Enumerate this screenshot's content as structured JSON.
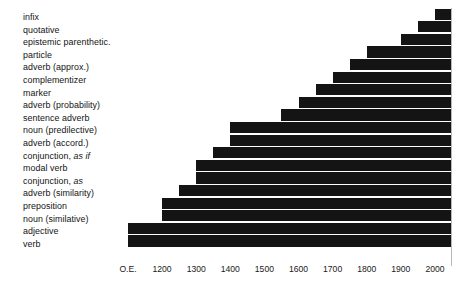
{
  "chart_data": {
    "type": "bar",
    "orientation": "horizontal",
    "title": "",
    "subtitle": "",
    "xlabel": "",
    "ylabel": "",
    "grid": false,
    "legend": null,
    "bar_color": "#141414",
    "background_color": "#ffffff",
    "axis_color": "#b9b9b9",
    "xlim": [
      1100,
      2050
    ],
    "x_tick_labels": [
      "O.E.",
      "1200",
      "1300",
      "1400",
      "1500",
      "1600",
      "1700",
      "1800",
      "1900",
      "2000"
    ],
    "x_tick_values": [
      1100,
      1200,
      1300,
      1400,
      1500,
      1600,
      1700,
      1800,
      1900,
      2000
    ],
    "note": "Each bar spans from its first-attestation date to the present (2050 right edge); bar length encodes duration of attested use.",
    "categories": [
      "infix",
      "quotative",
      "epistemic parenthetic.",
      "particle",
      "adverb (approx.)",
      "complementizer",
      "marker",
      "adverb (probability)",
      "sentence adverb",
      "noun (predilective)",
      "adverb (accord.)",
      "conjunction, as if",
      "modal verb",
      "conjunction, as",
      "adverb (similarity)",
      "preposition",
      "noun (similative)",
      "adjective",
      "verb"
    ],
    "bars": [
      {
        "label": "infix",
        "label_plain": "infix",
        "label_italic": "",
        "start": 2000,
        "end": 2050
      },
      {
        "label": "quotative",
        "label_plain": "quotative",
        "label_italic": "",
        "start": 1950,
        "end": 2050
      },
      {
        "label": "epistemic parenthetic.",
        "label_plain": "epistemic parenthetic.",
        "label_italic": "",
        "start": 1900,
        "end": 2050
      },
      {
        "label": "particle",
        "label_plain": "particle",
        "label_italic": "",
        "start": 1800,
        "end": 2050
      },
      {
        "label": "adverb (approx.)",
        "label_plain": "adverb (approx.)",
        "label_italic": "",
        "start": 1750,
        "end": 2050
      },
      {
        "label": "complementizer",
        "label_plain": "complementizer",
        "label_italic": "",
        "start": 1700,
        "end": 2050
      },
      {
        "label": "marker",
        "label_plain": "marker",
        "label_italic": "",
        "start": 1650,
        "end": 2050
      },
      {
        "label": "adverb (probability)",
        "label_plain": "adverb (probability)",
        "label_italic": "",
        "start": 1600,
        "end": 2050
      },
      {
        "label": "sentence adverb",
        "label_plain": "sentence adverb",
        "label_italic": "",
        "start": 1550,
        "end": 2050
      },
      {
        "label": "noun (predilective)",
        "label_plain": "noun (predilective)",
        "label_italic": "",
        "start": 1400,
        "end": 2050
      },
      {
        "label": "adverb (accord.)",
        "label_plain": "adverb (accord.)",
        "label_italic": "",
        "start": 1400,
        "end": 2050
      },
      {
        "label": "conjunction, as if",
        "label_plain": "conjunction, ",
        "label_italic": "as if",
        "start": 1350,
        "end": 2050
      },
      {
        "label": "modal verb",
        "label_plain": "modal verb",
        "label_italic": "",
        "start": 1300,
        "end": 2050
      },
      {
        "label": "conjunction, as",
        "label_plain": "conjunction, ",
        "label_italic": "as",
        "start": 1300,
        "end": 2050
      },
      {
        "label": "adverb (similarity)",
        "label_plain": "adverb (similarity)",
        "label_italic": "",
        "start": 1250,
        "end": 2050
      },
      {
        "label": "preposition",
        "label_plain": "preposition",
        "label_italic": "",
        "start": 1200,
        "end": 2050
      },
      {
        "label": "noun (similative)",
        "label_plain": "noun (similative)",
        "label_italic": "",
        "start": 1200,
        "end": 2050
      },
      {
        "label": "adjective",
        "label_plain": "adjective",
        "label_italic": "",
        "start": 1100,
        "end": 2050
      },
      {
        "label": "verb",
        "label_plain": "verb",
        "label_italic": "",
        "start": 1100,
        "end": 2050
      }
    ]
  }
}
